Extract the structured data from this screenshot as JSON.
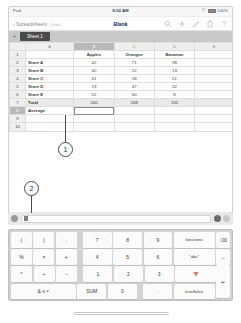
{
  "status_bar": {
    "carrier": "Pad",
    "time": "9:03 AM",
    "wifi_icon": "wifi-icon",
    "battery_label": "100%"
  },
  "toolbar": {
    "back_icon": "chevron-left-icon",
    "back_label": "Spreadsheets",
    "undo_label": "Undo",
    "document_title": "Blank",
    "icons": [
      {
        "name": "search-icon",
        "glyph": "search"
      },
      {
        "name": "insert-icon",
        "glyph": "plus"
      },
      {
        "name": "format-brush-icon",
        "glyph": "brush"
      },
      {
        "name": "tools-icon",
        "glyph": "wrench"
      },
      {
        "name": "help-icon",
        "glyph": "question"
      }
    ]
  },
  "sheet_tabs": {
    "add_label": "+",
    "tabs": [
      {
        "label": "Sheet 1",
        "active": true
      }
    ]
  },
  "spreadsheet": {
    "columns": [
      {
        "letter": "A",
        "selected": false
      },
      {
        "letter": "B",
        "selected": true
      },
      {
        "letter": "C",
        "selected": false
      },
      {
        "letter": "D",
        "selected": false
      },
      {
        "letter": "E",
        "selected": false
      }
    ],
    "rows": [
      {
        "num": "1",
        "cells": [
          "",
          "Apples",
          "Oranges",
          "Bananas",
          ""
        ],
        "type": "header"
      },
      {
        "num": "2",
        "cells": [
          "Store A",
          "42",
          "71",
          "38",
          ""
        ],
        "type": "data"
      },
      {
        "num": "3",
        "cells": [
          "Store B",
          "60",
          "12",
          "13",
          ""
        ],
        "type": "data"
      },
      {
        "num": "4",
        "cells": [
          "Store C",
          "41",
          "58",
          "51",
          ""
        ],
        "type": "data"
      },
      {
        "num": "5",
        "cells": [
          "Store D",
          "19",
          "47",
          "32",
          ""
        ],
        "type": "data"
      },
      {
        "num": "6",
        "cells": [
          "Store E",
          "52",
          "60",
          "8",
          ""
        ],
        "type": "data"
      },
      {
        "num": "7",
        "cells": [
          "Total",
          "240",
          "248",
          "132",
          ""
        ],
        "type": "total"
      },
      {
        "num": "8",
        "cells": [
          "Average",
          "",
          "",
          "",
          ""
        ],
        "type": "selected",
        "selected_col": 1
      },
      {
        "num": "9",
        "cells": [
          "",
          "",
          "",
          "",
          ""
        ],
        "type": "empty"
      },
      {
        "num": "10",
        "cells": [
          "",
          "",
          "",
          "",
          ""
        ],
        "type": "empty"
      }
    ]
  },
  "callouts": [
    {
      "label": "1",
      "target": "selected-cell"
    },
    {
      "label": "2",
      "target": "formula-bar"
    }
  ],
  "formula_bar": {
    "cell_ref_icon": "cell-reference-icon",
    "value": "",
    "placeholder": "",
    "cancel_icon": "cancel-icon",
    "accept_icon": "accept-icon"
  },
  "keyboard": {
    "rows": [
      [
        {
          "label": "(",
          "name": "key-open-paren",
          "size": "op"
        },
        {
          "label": ")",
          "name": "key-close-paren",
          "size": "op"
        },
        {
          "label": ",",
          "name": "key-comma",
          "size": "op"
        },
        {
          "label": "7",
          "name": "key-7",
          "size": "num"
        },
        {
          "label": "8",
          "name": "key-8",
          "size": "num"
        },
        {
          "label": "9",
          "name": "key-9",
          "size": "num"
        },
        {
          "label": "functions",
          "name": "key-functions",
          "size": "fn"
        },
        {
          "label": "⌫",
          "name": "key-backspace",
          "size": "side"
        }
      ],
      [
        {
          "label": "%",
          "name": "key-percent",
          "size": "op"
        },
        {
          "label": "×",
          "name": "key-multiply",
          "size": "op"
        },
        {
          "label": "+",
          "name": "key-plus",
          "size": "op"
        },
        {
          "label": "4",
          "name": "key-4",
          "size": "num"
        },
        {
          "label": "5",
          "name": "key-5",
          "size": "num"
        },
        {
          "label": "6",
          "name": "key-6",
          "size": "num"
        },
        {
          "label": "\"abc\"",
          "name": "key-text",
          "size": "fn"
        },
        {
          "label": "→",
          "name": "key-next",
          "size": "side"
        }
      ],
      [
        {
          "label": "^",
          "name": "key-caret",
          "size": "op"
        },
        {
          "label": "÷",
          "name": "key-divide",
          "size": "op"
        },
        {
          "label": "−",
          "name": "key-minus",
          "size": "op"
        },
        {
          "label": "1",
          "name": "key-1",
          "size": "num"
        },
        {
          "label": "2",
          "name": "key-2",
          "size": "num"
        },
        {
          "label": "3",
          "name": "key-3",
          "size": "num"
        },
        {
          "label": "📅",
          "name": "key-date-time",
          "size": "fn"
        }
      ],
      [
        {
          "label": "& ≤ ≠",
          "name": "key-operators",
          "size": "wide"
        },
        {
          "label": "SUM",
          "name": "key-sum",
          "size": "num"
        },
        {
          "label": "0",
          "name": "key-0",
          "size": "num"
        },
        {
          "label": ".",
          "name": "key-decimal",
          "size": "num"
        },
        {
          "label": "true/false",
          "name": "key-boolean",
          "size": "fn"
        }
      ]
    ],
    "enter_key": {
      "label": "↵",
      "name": "key-enter"
    }
  }
}
